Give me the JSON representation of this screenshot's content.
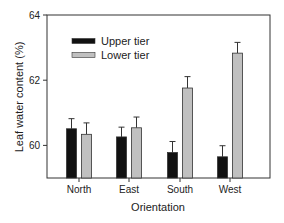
{
  "chart_data": {
    "type": "bar",
    "title": "",
    "xlabel": "Orientation",
    "ylabel": "Leaf water content (%)",
    "categories": [
      "North",
      "East",
      "South",
      "West"
    ],
    "series": [
      {
        "name": "Upper tier",
        "color": "#111111",
        "values": [
          60.51,
          60.26,
          59.78,
          59.65
        ],
        "errors": [
          0.31,
          0.3,
          0.34,
          0.34
        ]
      },
      {
        "name": "Lower tier",
        "color": "#c0c0c0",
        "values": [
          60.34,
          60.54,
          61.76,
          62.83
        ],
        "errors": [
          0.35,
          0.33,
          0.35,
          0.33
        ]
      }
    ],
    "ylim": [
      59,
      64
    ],
    "yticks": [
      60,
      62,
      64
    ],
    "grid": false,
    "legend_position": "upper left"
  }
}
